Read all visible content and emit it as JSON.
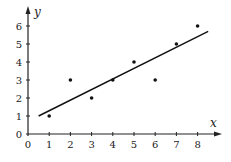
{
  "chart_data": {
    "type": "scatter",
    "title": "",
    "xlabel": "x",
    "ylabel": "y",
    "xlim": [
      0,
      9
    ],
    "ylim": [
      0,
      6.8
    ],
    "grid": false,
    "x_ticks": [
      "0",
      "1",
      "2",
      "3",
      "4",
      "5",
      "6",
      "7",
      "8"
    ],
    "y_ticks": [
      "0",
      "1",
      "2",
      "3",
      "4",
      "5",
      "6"
    ],
    "series": [
      {
        "name": "points",
        "type": "scatter",
        "x": [
          1,
          2,
          3,
          4,
          5,
          6,
          7,
          8
        ],
        "y": [
          1,
          3,
          2,
          3,
          4,
          3,
          5,
          6
        ]
      },
      {
        "name": "best-fit line",
        "type": "line",
        "x": [
          0.5,
          8.5
        ],
        "y": [
          1.0,
          5.7
        ]
      }
    ]
  }
}
